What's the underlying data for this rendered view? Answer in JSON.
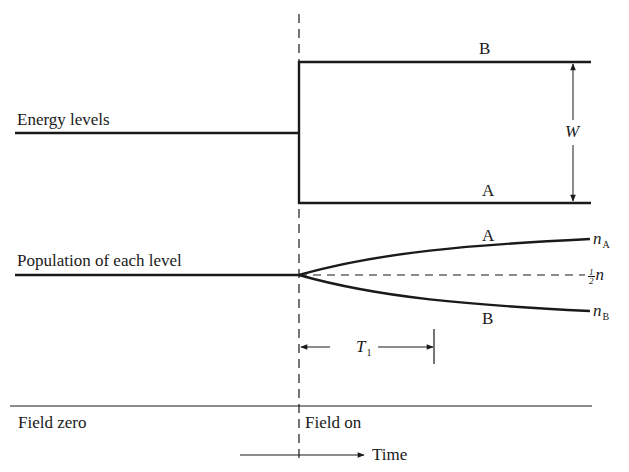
{
  "diagram": {
    "left_labels": {
      "energy": "Energy levels",
      "population": "Population of each level"
    },
    "energy_levels": {
      "upper_label": "B",
      "lower_label": "A",
      "gap_label": "W"
    },
    "population": {
      "upper_curve_label": "A",
      "lower_curve_label": "B",
      "end_upper": {
        "symbol": "n",
        "subscript": "A"
      },
      "end_lower": {
        "symbol": "n",
        "subscript": "B"
      },
      "midline": {
        "numerator": "1",
        "denominator": "2",
        "symbol": "n"
      }
    },
    "relaxation": {
      "symbol": "T",
      "subscript": "1"
    },
    "field": {
      "before": "Field zero",
      "after": "Field on"
    },
    "time_axis": {
      "label": "Time"
    },
    "colors": {
      "ink": "#1a1a1a",
      "background": "#ffffff"
    }
  }
}
